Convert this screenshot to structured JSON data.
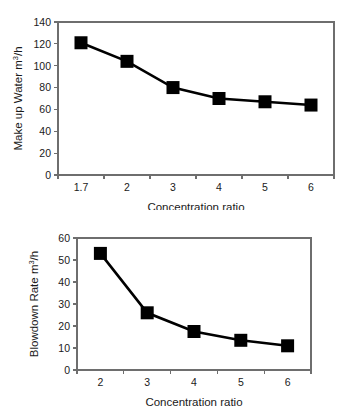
{
  "figure": {
    "background_color": "#ffffff",
    "axis_color": "#6e6e6e",
    "series_color": "#000000"
  },
  "chart_data": [
    {
      "id": "make-up-water",
      "type": "line",
      "title": "",
      "xlabel": "Concentration ratio",
      "ylabel": "Make up Water m3/h",
      "ylabel_prefix": "Make up Water m",
      "ylabel_superscript": "3",
      "ylabel_suffix": "/h",
      "categories": [
        "1.7",
        "2",
        "3",
        "4",
        "5",
        "6"
      ],
      "x": [
        1.7,
        2,
        3,
        4,
        5,
        6
      ],
      "values": [
        121,
        104,
        80,
        70,
        67,
        64
      ],
      "ylim": [
        0,
        140
      ],
      "yticks": [
        0,
        20,
        40,
        60,
        80,
        100,
        120,
        140
      ],
      "ytick_labels": [
        "0",
        "20",
        "40",
        "60",
        "80",
        "100",
        "120",
        "140"
      ],
      "xtick_labels": [
        "1.7",
        "2",
        "3",
        "4",
        "5",
        "6"
      ],
      "grid": false,
      "legend": "none",
      "marker": "square"
    },
    {
      "id": "blowdown-rate",
      "type": "line",
      "title": "",
      "xlabel": "Concentration ratio",
      "ylabel": "Blowdown Rate m3/h",
      "ylabel_prefix": "Blowdown Rate m",
      "ylabel_superscript": "3",
      "ylabel_suffix": "/h",
      "categories": [
        "2",
        "3",
        "4",
        "5",
        "6"
      ],
      "x": [
        2,
        3,
        4,
        5,
        6
      ],
      "values": [
        53,
        26,
        17.5,
        13.5,
        11
      ],
      "ylim": [
        0,
        60
      ],
      "yticks": [
        0,
        10,
        20,
        30,
        40,
        50,
        60
      ],
      "ytick_labels": [
        "0",
        "10",
        "20",
        "30",
        "40",
        "50",
        "60"
      ],
      "xtick_labels": [
        "2",
        "3",
        "4",
        "5",
        "6"
      ],
      "grid": false,
      "legend": "none",
      "marker": "square"
    }
  ]
}
